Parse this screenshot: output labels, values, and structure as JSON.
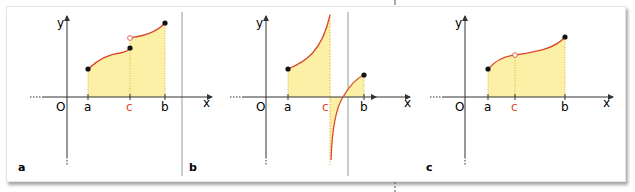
{
  "figure": {
    "panels": [
      {
        "id": "a",
        "label": "a",
        "axis_x": "x",
        "axis_y": "y",
        "origin": "O",
        "ticks": [
          "a",
          "c",
          "b"
        ],
        "description": "Function with jump discontinuity at c; filled points at a, at c (lower), and at b; open point at c (upper)"
      },
      {
        "id": "b",
        "label": "b",
        "axis_x": "x",
        "axis_y": "y",
        "origin": "O",
        "ticks": [
          "a",
          "c",
          "b"
        ],
        "description": "Function with vertical asymptote at c; left branch rises to +infinity, right branch comes from -infinity"
      },
      {
        "id": "c",
        "label": "c",
        "axis_x": "x",
        "axis_y": "y",
        "origin": "O",
        "ticks": [
          "a",
          "c",
          "b"
        ],
        "description": "Function with removable discontinuity at c (open point on the curve)"
      }
    ],
    "colors": {
      "curve": "#d9482b",
      "fill": "#fcefa6",
      "axis": "#333333",
      "c_label": "#d9482b",
      "point": "#111111",
      "divider": "#9a9a9a"
    }
  }
}
